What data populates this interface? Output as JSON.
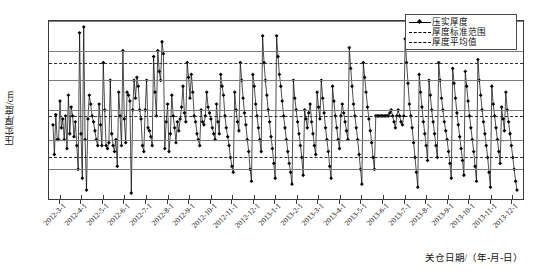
{
  "chart_data": {
    "type": "line",
    "title": "",
    "xlabel": "关仓日期/（年-月-日）",
    "ylabel": "压实厚度/cm",
    "ylim": [
      65,
      95
    ],
    "yticks": [
      95,
      90,
      88,
      85,
      80,
      79,
      75,
      72,
      70,
      65
    ],
    "grid": true,
    "legend_position": "top-right",
    "xtick_labels": [
      "2012-3-1",
      "2012-4-1",
      "2012-5-1",
      "2012-6-1",
      "2012-7-1",
      "2012-8-1",
      "2012-9-1",
      "2012-10-1",
      "2012-11-1",
      "2012-12-1",
      "2013-1-1",
      "2013-2-1",
      "2013-3-1",
      "2013-4-1",
      "2013-5-1",
      "2013-6-1",
      "2013-7-1",
      "2013-8-1",
      "2013-9-1",
      "2013-10-1",
      "2013-11-1",
      "2013-12-1"
    ],
    "reference_lines": [
      {
        "name": "厚度标准范围上限",
        "value": 88,
        "style": "dashdot"
      },
      {
        "name": "厚度标准范围下限",
        "value": 72,
        "style": "dashdot"
      },
      {
        "name": "厚度平均值",
        "value": 79,
        "style": "dashed"
      }
    ],
    "legend": [
      {
        "label": "压实厚度",
        "style": "solid-marker"
      },
      {
        "label": "厚度标准范围",
        "style": "dashdot"
      },
      {
        "label": "厚度平均值",
        "style": "dashed"
      }
    ],
    "series": [
      {
        "name": "压实厚度",
        "color": "#000000",
        "marker": "diamond",
        "values": [
          77.5,
          72.5,
          79.2,
          75.0,
          75.0,
          81.5,
          77.0,
          78.5,
          75.0,
          79.0,
          73.5,
          82.5,
          76.0,
          80.5,
          79.0,
          75.5,
          78.0,
          74.0,
          70.0,
          93.0,
          76.0,
          68.5,
          94.0,
          75.0,
          66.5,
          78.5,
          82.5,
          81.0,
          79.0,
          78.0,
          76.5,
          75.0,
          74.0,
          81.0,
          77.5,
          74.0,
          88.0,
          80.0,
          74.0,
          73.5,
          74.5,
          85.0,
          76.0,
          74.0,
          73.0,
          75.0,
          70.5,
          83.0,
          79.0,
          74.0,
          90.0,
          78.5,
          74.5,
          83.0,
          82.5,
          81.5,
          66.0,
          80.0,
          85.0,
          82.0,
          85.5,
          84.0,
          80.0,
          78.5,
          74.0,
          73.0,
          80.0,
          85.0,
          77.0,
          76.5,
          75.5,
          74.0,
          89.0,
          83.0,
          79.0,
          90.0,
          86.5,
          85.0,
          91.5,
          89.5,
          73.5,
          78.0,
          81.0,
          73.0,
          76.0,
          82.5,
          79.0,
          77.0,
          74.5,
          78.0,
          76.5,
          78.5,
          80.5,
          84.0,
          79.5,
          78.0,
          88.0,
          85.5,
          82.0,
          86.0,
          83.0,
          79.0,
          78.0,
          76.0,
          75.0,
          74.0,
          80.0,
          78.0,
          77.5,
          79.0,
          83.0,
          80.5,
          79.5,
          78.5,
          77.0,
          76.0,
          75.0,
          81.0,
          78.0,
          76.0,
          86.0,
          84.0,
          82.5,
          79.0,
          77.0,
          75.5,
          74.0,
          72.0,
          70.5,
          69.5,
          83.0,
          80.0,
          78.0,
          76.5,
          88.0,
          85.0,
          82.0,
          79.5,
          77.5,
          75.0,
          73.0,
          70.0,
          68.0,
          86.0,
          84.0,
          81.0,
          79.0,
          77.0,
          75.0,
          73.0,
          92.5,
          88.0,
          85.0,
          82.5,
          80.0,
          78.0,
          75.5,
          73.5,
          71.0,
          68.5,
          92.5,
          89.0,
          86.0,
          84.0,
          81.5,
          79.0,
          77.0,
          75.0,
          73.0,
          71.0,
          69.5,
          67.5,
          85.0,
          82.0,
          80.0,
          78.0,
          76.0,
          74.0,
          72.0,
          69.0,
          80.0,
          78.5,
          77.0,
          79.5,
          81.0,
          78.0,
          76.0,
          74.0,
          72.5,
          83.0,
          80.5,
          78.5,
          85.0,
          82.0,
          79.5,
          77.0,
          75.0,
          73.0,
          70.5,
          68.5,
          84.0,
          81.5,
          79.0,
          77.0,
          75.0,
          73.5,
          79.0,
          81.0,
          79.5,
          78.0,
          76.5,
          75.0,
          90.5,
          87.0,
          84.0,
          81.0,
          79.0,
          77.0,
          75.0,
          72.5,
          70.0,
          67.5,
          88.0,
          85.5,
          83.0,
          80.5,
          78.5,
          76.5,
          74.5,
          72.0,
          70.0,
          79.0,
          79.0,
          79.0,
          79.0,
          79.0,
          79.0,
          79.0,
          79.0,
          79.0,
          79.0,
          79.5,
          80.0,
          79.0,
          78.0,
          77.0,
          79.0,
          80.0,
          79.0,
          78.0,
          77.5,
          79.0,
          92.0,
          88.0,
          84.5,
          81.0,
          79.0,
          77.0,
          74.5,
          72.0,
          69.5,
          67.0,
          86.0,
          83.0,
          80.5,
          78.0,
          76.0,
          74.0,
          71.5,
          85.0,
          82.5,
          80.0,
          78.0,
          76.0,
          74.0,
          72.0,
          88.0,
          85.0,
          82.0,
          80.0,
          78.0,
          76.5,
          75.0,
          73.0,
          71.0,
          68.5,
          87.0,
          84.5,
          82.0,
          79.5,
          77.5,
          75.5,
          73.5,
          71.5,
          69.0,
          86.5,
          84.0,
          81.5,
          79.0,
          77.0,
          75.0,
          73.0,
          70.5,
          68.0,
          88.5,
          85.0,
          82.5,
          80.0,
          78.0,
          76.0,
          74.0,
          72.0,
          69.5,
          67.0,
          84.0,
          81.0,
          79.0,
          77.0,
          75.0,
          73.0,
          71.0,
          80.5,
          78.5,
          76.5,
          83.0,
          80.0,
          78.0,
          76.0,
          74.0,
          72.0,
          70.0,
          68.0,
          66.5
        ]
      }
    ]
  },
  "axis": {
    "y_title": "压实厚度/cm",
    "x_title": "关仓日期/（年-月-日）"
  }
}
